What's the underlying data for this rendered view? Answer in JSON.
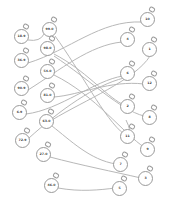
{
  "diagram": {
    "type": "matching-puzzle",
    "line_color": "#b8b8b8",
    "outline_color": "#9a9a9a",
    "left_bombs": [
      {
        "label": "18.9",
        "x": 22,
        "y": 37
      },
      {
        "label": "99.0",
        "x": 50,
        "y": 30
      },
      {
        "label": "36.9",
        "x": 22,
        "y": 61
      },
      {
        "label": "98.0",
        "x": 48,
        "y": 49
      },
      {
        "label": "90.9",
        "x": 22,
        "y": 89
      },
      {
        "label": "54.0",
        "x": 48,
        "y": 72
      },
      {
        "label": "81.0",
        "x": 48,
        "y": 96
      },
      {
        "label": "6.9",
        "x": 20,
        "y": 113
      },
      {
        "label": "63.0",
        "x": 47,
        "y": 122
      },
      {
        "label": "72.9",
        "x": 23,
        "y": 141
      },
      {
        "label": "27.0",
        "x": 44,
        "y": 155
      },
      {
        "label": "46.0",
        "x": 52,
        "y": 186
      }
    ],
    "right_bombs": [
      {
        "label": "10",
        "x": 148,
        "y": 20
      },
      {
        "label": "4",
        "x": 128,
        "y": 40
      },
      {
        "label": "1",
        "x": 150,
        "y": 50
      },
      {
        "label": "6",
        "x": 128,
        "y": 74
      },
      {
        "label": "12",
        "x": 150,
        "y": 84
      },
      {
        "label": "2",
        "x": 128,
        "y": 107
      },
      {
        "label": "8",
        "x": 150,
        "y": 118
      },
      {
        "label": "11",
        "x": 128,
        "y": 137
      },
      {
        "label": "9",
        "x": 148,
        "y": 150
      },
      {
        "label": "7",
        "x": 121,
        "y": 165
      },
      {
        "label": "3",
        "x": 146,
        "y": 179
      },
      {
        "label": "5",
        "x": 120,
        "y": 189
      }
    ],
    "connections": [
      {
        "from": "18.9",
        "to": "99.0",
        "d": "M28,40 Q40,42 44,34"
      },
      {
        "from": "36.9",
        "to": "10",
        "d": "M28,63 C70,50 100,20 142,22"
      },
      {
        "from": "90.9",
        "to": "4",
        "d": "M28,90 C60,70 90,45 122,42"
      },
      {
        "from": "99.0",
        "to": "11",
        "d": "M55,36 C80,70 105,120 124,134"
      },
      {
        "from": "98.0",
        "to": "2",
        "d": "M54,54 C85,70 105,95 122,104"
      },
      {
        "from": "98.0",
        "to": "8",
        "d": "M54,56 C90,80 120,110 144,116"
      },
      {
        "from": "54.0",
        "to": "9",
        "d": "M54,75 C95,95 125,135 144,147"
      },
      {
        "from": "81.0",
        "to": "12",
        "d": "M54,97 C80,95 110,80 144,84"
      },
      {
        "from": "6.9",
        "to": "6",
        "d": "M26,114 C60,110 95,80 123,76"
      },
      {
        "from": "63.0",
        "to": "1",
        "d": "M52,120 C85,100 135,80 150,56"
      },
      {
        "from": "72.9",
        "to": "6b",
        "d": "M29,138 C60,110 95,85 124,78"
      },
      {
        "from": "63.0",
        "to": "7",
        "d": "M52,126 C70,140 90,160 116,164"
      },
      {
        "from": "27.0",
        "to": "3",
        "d": "M50,157 C80,165 115,172 141,178"
      },
      {
        "from": "46.0",
        "to": "5",
        "d": "M58,188 C80,192 100,190 115,188"
      },
      {
        "from": "9",
        "to": "11",
        "d": "M126,120 Q132,132 128,134"
      }
    ]
  }
}
